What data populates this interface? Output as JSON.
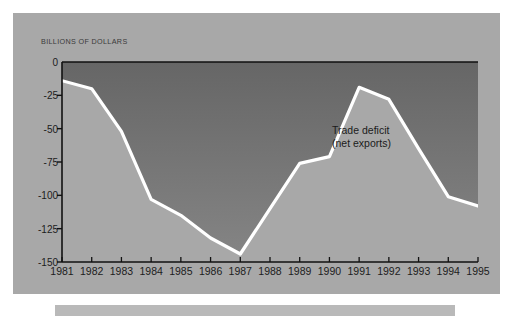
{
  "figure": {
    "panel_bg": "#a8a8a8",
    "plot_fill_top": "#6d6d6d",
    "plot_fill_bottom": "#7d7d7d",
    "below_line_fill": "#a8a8a8",
    "line_color": "#ffffff",
    "axis_color": "#111111",
    "caption_bar_color": "#b9b9b9"
  },
  "axis_title": "BILLIONS OF DOLLARS",
  "annotation": {
    "line1": "Trade deficit",
    "line2": "(net exports)"
  },
  "chart_data": {
    "type": "area",
    "title": "",
    "subtitle": "",
    "xlabel": "",
    "ylabel": "BILLIONS OF DOLLARS",
    "categories": [
      "1981",
      "1982",
      "1983",
      "1984",
      "1985",
      "1986",
      "1987",
      "1988",
      "1989",
      "1990",
      "1991",
      "1992",
      "1993",
      "1994",
      "1995"
    ],
    "x": [
      1981,
      1982,
      1983,
      1984,
      1985,
      1986,
      1987,
      1988,
      1989,
      1990,
      1991,
      1992,
      1993,
      1994,
      1995
    ],
    "values": [
      -14,
      -20,
      -52,
      -103,
      -115,
      -132,
      -144,
      -110,
      -76,
      -71,
      -19,
      -28,
      -65,
      -101,
      -108
    ],
    "series": [
      {
        "name": "Trade deficit (net exports)",
        "values": [
          -14,
          -20,
          -52,
          -103,
          -115,
          -132,
          -144,
          -110,
          -76,
          -71,
          -19,
          -28,
          -65,
          -101,
          -108
        ]
      }
    ],
    "ylim": [
      -150,
      0
    ],
    "xlim": [
      1981,
      1995
    ],
    "ytick_labels": [
      "0",
      "-25",
      "-50",
      "-75",
      "-100",
      "-125",
      "-150"
    ],
    "ytick_values": [
      0,
      -25,
      -50,
      -75,
      -100,
      -125,
      -150
    ],
    "xtick_labels": [
      "1981",
      "1982",
      "1983",
      "1984",
      "1985",
      "1986",
      "1987",
      "1988",
      "1989",
      "1990",
      "1991",
      "1992",
      "1993",
      "1994",
      "1995"
    ],
    "grid": false,
    "legend": "none",
    "annotations": [
      "Trade deficit",
      "(net exports)"
    ]
  }
}
